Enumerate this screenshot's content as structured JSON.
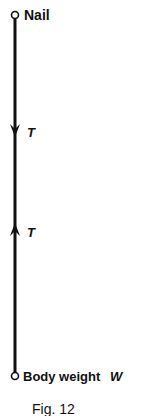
{
  "diagram": {
    "top_label": "Nail",
    "tension_top": "T",
    "tension_bottom": "T",
    "bottom_label": "Body weight",
    "bottom_symbol": "W",
    "caption": "Fig. 12",
    "colors": {
      "ink": "#111111",
      "background": "#ffffff"
    }
  }
}
